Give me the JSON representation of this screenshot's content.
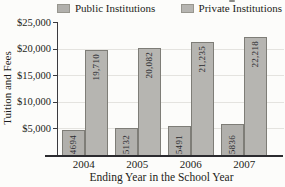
{
  "chart_data": {
    "type": "bar",
    "title": "",
    "xlabel": "Ending Year in the School Year",
    "ylabel": "Tuition and Fees",
    "categories": [
      "2004",
      "2005",
      "2006",
      "2007"
    ],
    "series": [
      {
        "name": "Public Institutions",
        "values": [
          4694,
          5132,
          5491,
          5836
        ],
        "labels": [
          "4694",
          "5132",
          "5491",
          "5836"
        ],
        "color": "#b1b0ac"
      },
      {
        "name": "Private Institutions",
        "values": [
          19710,
          20082,
          21235,
          22218
        ],
        "labels": [
          "19,710",
          "20,082",
          "21,235",
          "22,218"
        ],
        "color": "#b6b5b1"
      }
    ],
    "ylim": [
      0,
      25000
    ],
    "yticks": [
      {
        "value": 25000,
        "label": "$25,000"
      },
      {
        "value": 20000,
        "label": "$20,000"
      },
      {
        "value": 15000,
        "label": "$15,000"
      },
      {
        "value": 10000,
        "label": "$10,000"
      },
      {
        "value": 5000,
        "label": "$5,000"
      }
    ],
    "grid": true,
    "legend_position": "top",
    "grid_color": "#e4e3df",
    "axis_color": "#3a3a3e",
    "bar_border_color": "#7e7d77"
  }
}
